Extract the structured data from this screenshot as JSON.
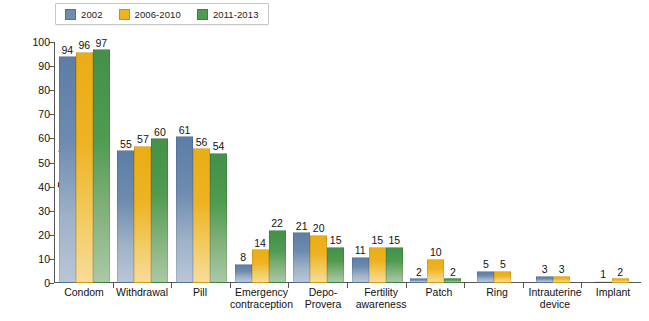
{
  "legend": {
    "position": "top-left",
    "items": [
      {
        "label": "2002",
        "color": "#6e8cb0",
        "key": "2002"
      },
      {
        "label": "2006-2010",
        "color": "#eeb323",
        "key": "2006-2010"
      },
      {
        "label": "2011-2013",
        "color": "#4f9b4f",
        "key": "2011-2013"
      }
    ]
  },
  "axis": {
    "y_title": "Percent",
    "y_ticks": [
      "0",
      "10",
      "20",
      "30",
      "40",
      "50",
      "60",
      "70",
      "80",
      "90",
      "100"
    ]
  },
  "chart_data": {
    "type": "bar",
    "title": "",
    "subtitle": "",
    "xlabel": "",
    "ylabel": "Percent",
    "ylim": [
      0,
      100
    ],
    "ytick_step": 10,
    "grid": false,
    "legend_position": "top-left",
    "categories": [
      "Condom",
      "Withdrawal",
      "Pill",
      "Emergency contraception",
      "Depo-Provera",
      "Fertility awareness",
      "Patch",
      "Ring",
      "Intrauterine device",
      "Implant"
    ],
    "category_lines": [
      [
        "Condom"
      ],
      [
        "Withdrawal"
      ],
      [
        "Pill"
      ],
      [
        "Emergency",
        "contraception"
      ],
      [
        "Depo-",
        "Provera"
      ],
      [
        "Fertility",
        "awareness"
      ],
      [
        "Patch"
      ],
      [
        "Ring"
      ],
      [
        "Intrauterine",
        "device"
      ],
      [
        "Implant"
      ]
    ],
    "series": [
      {
        "name": "2002",
        "color": "#6e8cb0",
        "values": [
          94,
          55,
          61,
          8,
          21,
          11,
          2,
          5,
          3,
          1
        ]
      },
      {
        "name": "2006-2010",
        "color": "#eeb323",
        "values": [
          96,
          57,
          56,
          14,
          20,
          15,
          10,
          5,
          3,
          2
        ]
      },
      {
        "name": "2011-2013",
        "color": "#4f9b4f",
        "values": [
          97,
          60,
          54,
          22,
          15,
          15,
          2,
          null,
          null,
          null
        ]
      }
    ]
  }
}
